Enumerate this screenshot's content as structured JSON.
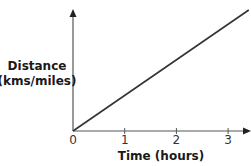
{
  "chart_data": {
    "type": "line",
    "title": "",
    "xlabel": "Time (hours)",
    "ylabel_lines": [
      "Distance",
      "(kms/miles)"
    ],
    "x_ticks": [
      0,
      1,
      2,
      3
    ],
    "x_tick_labels": [
      "0",
      "1",
      "2",
      "3"
    ],
    "xlim": [
      0,
      3.4
    ],
    "ylim": [
      0,
      1
    ],
    "y_ticks": [],
    "grid": false,
    "legend": "none",
    "series": [
      {
        "name": "distance",
        "x": [
          0,
          3.4
        ],
        "y": [
          0,
          1
        ],
        "color": "#333333"
      }
    ]
  },
  "colors": {
    "axis": "#555555",
    "line": "#333333"
  }
}
